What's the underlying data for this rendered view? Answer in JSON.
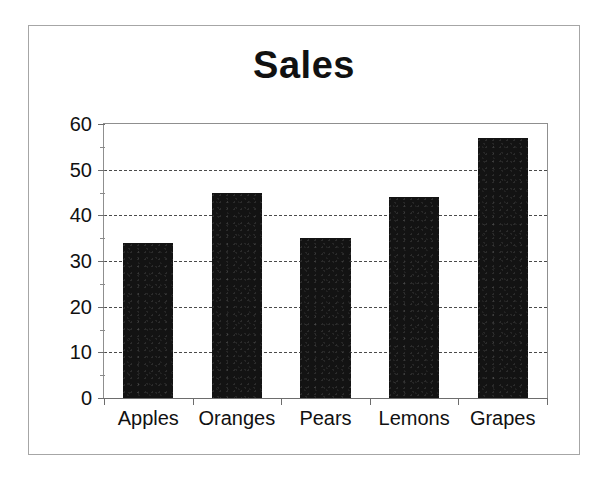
{
  "chart_data": {
    "type": "bar",
    "title": "Sales",
    "xlabel": "",
    "ylabel": "",
    "categories": [
      "Apples",
      "Oranges",
      "Pears",
      "Lemons",
      "Grapes"
    ],
    "values": [
      34,
      45,
      35,
      44,
      57
    ],
    "ylim": [
      0,
      60
    ],
    "ytick_labels": [
      "0",
      "10",
      "20",
      "30",
      "40",
      "50",
      "60"
    ],
    "ytick_values": [
      0,
      10,
      20,
      30,
      40,
      50,
      60
    ],
    "yminor_values": [
      5,
      15,
      25,
      35,
      45,
      55
    ],
    "gridlines": [
      10,
      20,
      30,
      40,
      50
    ],
    "grid": true,
    "grid_style": "dashed",
    "legend": "none",
    "bar_color": "#131313",
    "frame_color": "#8f8f8f",
    "text_color": "#111111"
  }
}
